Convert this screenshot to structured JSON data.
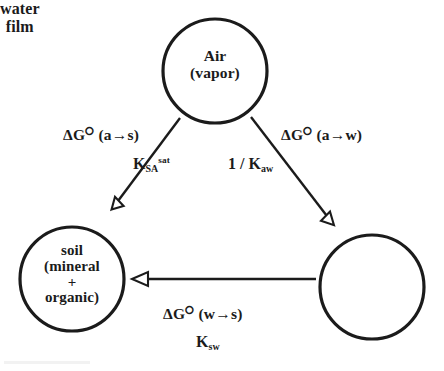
{
  "diagram": {
    "background_color": "#ffffff",
    "stroke_color": "#1b1b1b",
    "nodes": [
      {
        "id": "air",
        "label": "Air\n(vapor)",
        "cx": 215,
        "cy": 71,
        "r": 52
      },
      {
        "id": "soil",
        "label": "soil\n(mineral\n+\norganic)",
        "cx": 72,
        "cy": 279,
        "r": 52
      },
      {
        "id": "water_film",
        "label": "water\nfilm",
        "cx": 372,
        "cy": 287,
        "r": 52
      }
    ],
    "edges": [
      {
        "id": "air-to-soil",
        "from": "air",
        "to": "soil",
        "arrowhead": "hollow-triangle",
        "delta_g_label": "ΔG⭘ (a→s)",
        "delta_g_symbol": "ΔG",
        "standard_state_symbol": "⭘",
        "transition": "(a→s)",
        "constant_base": "K",
        "constant_sub": "SA",
        "constant_sup": "sat",
        "constant_prefix": ""
      },
      {
        "id": "air-to-water",
        "from": "air",
        "to": "water_film",
        "arrowhead": "hollow-triangle",
        "delta_g_label": "ΔG⭘ (a→w)",
        "delta_g_symbol": "ΔG",
        "standard_state_symbol": "⭘",
        "transition": "(a→w)",
        "constant_base": "K",
        "constant_sub": "aw",
        "constant_sup": "",
        "constant_prefix": "1 / "
      },
      {
        "id": "water-to-soil",
        "from": "water_film",
        "to": "soil",
        "arrowhead": "hollow-triangle",
        "delta_g_label": "ΔG⭘ (w→s)",
        "delta_g_symbol": "ΔG",
        "standard_state_symbol": "⭘",
        "transition": "(w→s)",
        "constant_base": "K",
        "constant_sub": "sw",
        "constant_sup": "",
        "constant_prefix": ""
      }
    ]
  }
}
